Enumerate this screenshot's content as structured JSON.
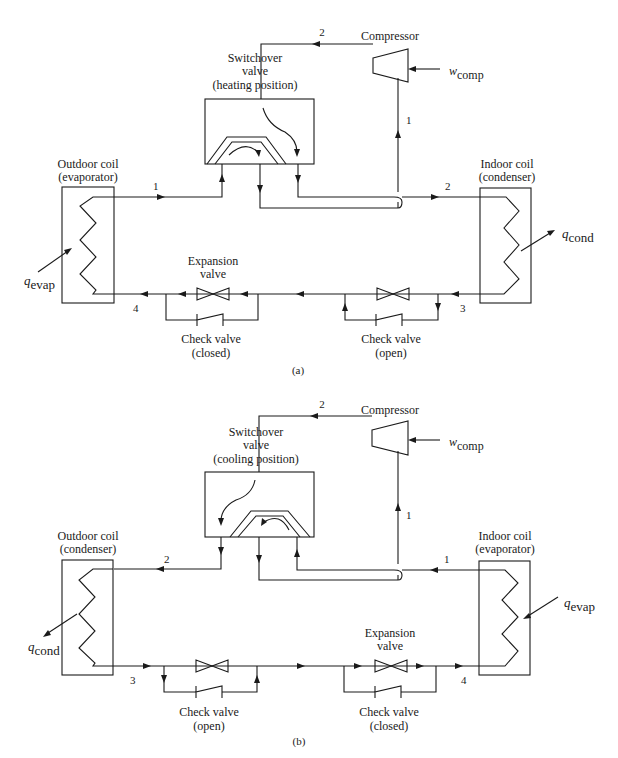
{
  "figure": {
    "panels": [
      {
        "id": "a",
        "caption": "(a)",
        "mode": "heating",
        "compressor": {
          "label": "Compressor",
          "work_symbol": "w",
          "work_subscript": "comp"
        },
        "switchover_valve": {
          "line1": "Switchover",
          "line2": "valve",
          "line3": "(heating position)"
        },
        "outdoor_coil": {
          "line1": "Outdoor coil",
          "line2": "(evaporator)",
          "heat_symbol": "q",
          "heat_subscript": "evap"
        },
        "indoor_coil": {
          "line1": "Indoor coil",
          "line2": "(condenser)",
          "heat_symbol": "q",
          "heat_subscript": "cond"
        },
        "expansion_valve": {
          "line1": "Expansion",
          "line2": "valve"
        },
        "check_valve_left": {
          "line1": "Check valve",
          "line2": "(closed)"
        },
        "check_valve_right": {
          "line1": "Check valve",
          "line2": "(open)"
        },
        "state_points": {
          "s1_left": "1",
          "s1_vertical": "1",
          "s2_top": "2",
          "s2_right": "2",
          "s3": "3",
          "s4": "4"
        }
      },
      {
        "id": "b",
        "caption": "(b)",
        "mode": "cooling",
        "compressor": {
          "label": "Compressor",
          "work_symbol": "w",
          "work_subscript": "comp"
        },
        "switchover_valve": {
          "line1": "Switchover",
          "line2": "valve",
          "line3": "(cooling position)"
        },
        "outdoor_coil": {
          "line1": "Outdoor coil",
          "line2": "(condenser)",
          "heat_symbol": "q",
          "heat_subscript": "cond"
        },
        "indoor_coil": {
          "line1": "Indoor coil",
          "line2": "(evaporator)",
          "heat_symbol": "q",
          "heat_subscript": "evap"
        },
        "expansion_valve": {
          "line1": "Expansion",
          "line2": "valve"
        },
        "check_valve_left": {
          "line1": "Check valve",
          "line2": "(open)"
        },
        "check_valve_right": {
          "line1": "Check valve",
          "line2": "(closed)"
        },
        "state_points": {
          "s1_right": "1",
          "s1_vertical": "1",
          "s2_top": "2",
          "s2_left": "2",
          "s3": "3",
          "s4": "4"
        }
      }
    ]
  },
  "colors": {
    "line": "#1a1a1a",
    "background": "#ffffff"
  }
}
